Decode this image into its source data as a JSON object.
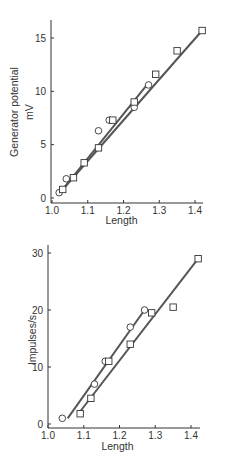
{
  "chart_data": [
    {
      "type": "scatter",
      "title": "",
      "xlabel": "Length",
      "ylabel": "Generator potential\nmV",
      "ylabel_lines": [
        "Generator potential",
        "mV"
      ],
      "xlim": [
        1.0,
        1.43
      ],
      "ylim": [
        -0.5,
        16.5
      ],
      "xticks": [
        1.0,
        1.1,
        1.2,
        1.3,
        1.4
      ],
      "xtick_labels": [
        "1.0",
        "1.1",
        "1.2",
        "1.3",
        "1.4"
      ],
      "yticks": [
        0,
        5,
        10,
        15
      ],
      "ytick_labels": [
        "0",
        "5",
        "10",
        "15"
      ],
      "grid": false,
      "legend": null,
      "series": [
        {
          "name": "circles",
          "marker": "circle",
          "x": [
            1.02,
            1.04,
            1.13,
            1.16,
            1.23,
            1.27
          ],
          "y": [
            0.5,
            1.8,
            6.3,
            7.3,
            8.5,
            10.6
          ],
          "fit_line": [
            [
              1.025,
              0.6
            ],
            [
              1.27,
              10.8
            ]
          ]
        },
        {
          "name": "squares",
          "marker": "square",
          "x": [
            1.03,
            1.06,
            1.09,
            1.13,
            1.17,
            1.23,
            1.29,
            1.35,
            1.42
          ],
          "y": [
            0.8,
            1.9,
            3.3,
            4.7,
            7.3,
            9.0,
            11.6,
            13.8,
            15.7
          ],
          "fit_line": [
            [
              1.03,
              0.8
            ],
            [
              1.42,
              15.7
            ]
          ]
        }
      ]
    },
    {
      "type": "scatter",
      "title": "",
      "xlabel": "Length",
      "ylabel": "Impulses/s",
      "ylabel_lines": [
        "Impulses/s"
      ],
      "xlim": [
        1.0,
        1.43
      ],
      "ylim": [
        -1,
        31
      ],
      "xticks": [
        1.0,
        1.1,
        1.2,
        1.3,
        1.4
      ],
      "xtick_labels": [
        "1.0",
        "1.1",
        "1.2",
        "1.3",
        "1.4"
      ],
      "yticks": [
        0,
        10,
        20,
        30
      ],
      "ytick_labels": [
        "0",
        "10",
        "20",
        "30"
      ],
      "grid": false,
      "legend": null,
      "series": [
        {
          "name": "circles",
          "marker": "circle",
          "x": [
            1.04,
            1.13,
            1.16,
            1.23,
            1.27
          ],
          "y": [
            1.0,
            7.0,
            11.0,
            17.0,
            20.0
          ],
          "fit_line": [
            [
              1.055,
              1.0
            ],
            [
              1.27,
              20.0
            ]
          ]
        },
        {
          "name": "squares",
          "marker": "square",
          "x": [
            1.09,
            1.12,
            1.17,
            1.23,
            1.29,
            1.35,
            1.42
          ],
          "y": [
            1.8,
            4.5,
            11.0,
            14.0,
            19.5,
            20.5,
            29.0
          ],
          "fit_line": [
            [
              1.085,
              1.8
            ],
            [
              1.42,
              29.0
            ]
          ]
        }
      ]
    }
  ]
}
